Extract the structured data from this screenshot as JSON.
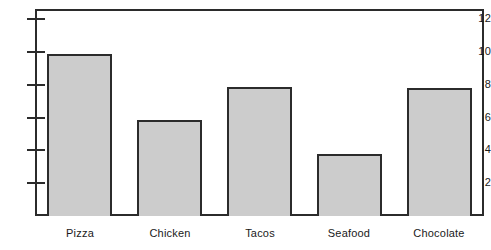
{
  "chart_data": {
    "type": "bar",
    "title": "",
    "subtitle": "",
    "xlabel": "",
    "ylabel": "",
    "categories": [
      "Pizza",
      "Chicken",
      "Tacos",
      "Seafood",
      "Chocolate"
    ],
    "values": [
      9.9,
      5.85,
      7.85,
      3.8,
      7.8
    ],
    "ylim": [
      0,
      12.8
    ],
    "yticks": [
      2,
      4,
      6,
      8,
      10,
      12
    ],
    "ytick_labels": [
      "2",
      "4",
      "6",
      "8",
      "10",
      "12"
    ],
    "grid": false,
    "legend": null,
    "bar_fill_color": "#cccccc",
    "bar_edge_color": "#2b2b2b",
    "axis_color": "#2b2b2b",
    "background_color": "#ffffff"
  }
}
